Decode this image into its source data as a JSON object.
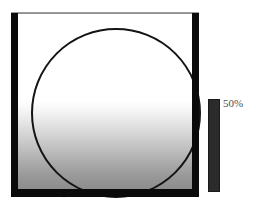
{
  "figure": {
    "type": "sphere-fill-gauge",
    "panel": {
      "frame_color": "#0a0a0a",
      "hairline_color": "#9b9b9b",
      "interior_top_color": "#ffffff",
      "interior_bottom_color": "#8d8d8d"
    },
    "circle": {
      "outline_color": "#141414",
      "fill": "gradient-white-to-gray"
    },
    "tick_mark": {
      "color": "#e6e6e6"
    },
    "scale": {
      "bar_color": "#2b2b2b",
      "label": "50%",
      "label_color": "#4d4d4d",
      "fill_percent": 50
    }
  }
}
